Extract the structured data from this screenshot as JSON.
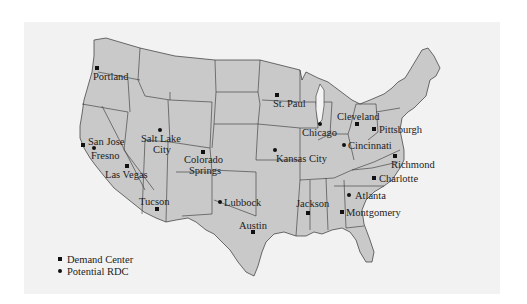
{
  "map": {
    "region": "Contiguous United States",
    "colors": {
      "land": "#c9c9c9",
      "border": "#333333",
      "background": "#f2f2f2",
      "marker": "#111111"
    }
  },
  "legend": {
    "items": [
      {
        "symbol": "square",
        "label": "Demand Center"
      },
      {
        "symbol": "dot",
        "label": "Potential RDC"
      }
    ]
  },
  "cities": [
    {
      "name": "Portland",
      "type": "square"
    },
    {
      "name": "St. Paul",
      "type": "square"
    },
    {
      "name": "Salt Lake City",
      "type": "dot"
    },
    {
      "name": "San Jose",
      "type": "square"
    },
    {
      "name": "Fresno",
      "type": "dot"
    },
    {
      "name": "Colorado Springs",
      "type": "square"
    },
    {
      "name": "Las Vegas",
      "type": "square"
    },
    {
      "name": "Kansas City",
      "type": "dot"
    },
    {
      "name": "Chicago",
      "type": "dot"
    },
    {
      "name": "Cleveland",
      "type": "square"
    },
    {
      "name": "Pittsburgh",
      "type": "square"
    },
    {
      "name": "Cincinnati",
      "type": "dot"
    },
    {
      "name": "Richmond",
      "type": "square"
    },
    {
      "name": "Charlotte",
      "type": "square"
    },
    {
      "name": "Atlanta",
      "type": "dot"
    },
    {
      "name": "Tucson",
      "type": "square"
    },
    {
      "name": "Lubbock",
      "type": "dot"
    },
    {
      "name": "Jackson",
      "type": "square"
    },
    {
      "name": "Montgomery",
      "type": "square"
    },
    {
      "name": "Austin",
      "type": "square"
    }
  ],
  "labels": {
    "portland": "Portland",
    "st_paul": "St. Paul",
    "salt_lake_1": "Salt Lake",
    "salt_lake_2": "City",
    "san_jose": "San Jose",
    "fresno": "Fresno",
    "colorado_1": "Colorado",
    "colorado_2": "Springs",
    "las_vegas": "Las Vegas",
    "kansas_city": "Kansas City",
    "chicago": "Chicago",
    "cleveland": "Cleveland",
    "pittsburgh": "Pittsburgh",
    "cincinnati": "Cincinnati",
    "richmond": "Richmond",
    "charlotte": "Charlotte",
    "atlanta": "Atlanta",
    "tucson": "Tucson",
    "lubbock": "Lubbock",
    "jackson": "Jackson",
    "montgomery": "Montgomery",
    "austin": "Austin"
  }
}
